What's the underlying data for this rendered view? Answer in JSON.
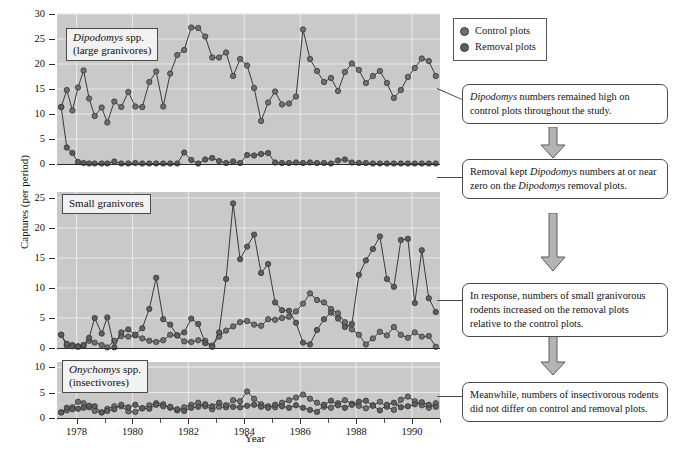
{
  "figure": {
    "x_axis_title": "Year",
    "y_axis_title": "Captures (per period)"
  },
  "legend": {
    "position": "top-right",
    "items": [
      {
        "label": "Control plots",
        "color": "#6f6f6f"
      },
      {
        "label": "Removal plots",
        "color": "#5e5e5e"
      }
    ]
  },
  "panels": [
    {
      "id": "dipodomys",
      "label_line1": "Dipodomys spp.",
      "label_line2": "(large granivores)",
      "label_italic_part": "Dipodomys",
      "yticks": [
        0,
        5,
        10,
        15,
        20,
        25,
        30
      ]
    },
    {
      "id": "small-granivores",
      "label_line1": "Small granivores",
      "label_line2": "",
      "label_italic_part": "",
      "yticks": [
        0,
        5,
        10,
        15,
        20,
        25
      ]
    },
    {
      "id": "onychomys",
      "label_line1": "Onychomys spp.",
      "label_line2": "(insectivores)",
      "label_italic_part": "Onychomys",
      "yticks": [
        0,
        5,
        10
      ]
    }
  ],
  "xticks": [
    {
      "value": 1978,
      "label": "1978"
    },
    {
      "value": 1980,
      "label": "1980"
    },
    {
      "value": 1982,
      "label": "1982"
    },
    {
      "value": 1984,
      "label": "1984"
    },
    {
      "value": 1986,
      "label": "1986"
    },
    {
      "value": 1988,
      "label": "1988"
    },
    {
      "value": 1990,
      "label": "1990"
    }
  ],
  "callouts": [
    {
      "id": "callout-1",
      "text_parts": [
        "",
        "Dipodomys",
        " numbers remained high on control plots throughout the study."
      ],
      "plain_text": "Dipodomys numbers remained high on control plots throughout the study."
    },
    {
      "id": "callout-2",
      "text_parts": [
        "Removal kept ",
        "Dipodomys",
        " numbers at or near zero on the ",
        "Dipodomys",
        " removal plots."
      ],
      "plain_text": "Removal kept Dipodomys numbers at or near zero on the Dipodomys removal plots."
    },
    {
      "id": "callout-3",
      "text_parts": [
        "In response, numbers of small granivorous rodents increased on the removal plots relative to the control plots."
      ],
      "plain_text": "In response, numbers of small granivorous rodents increased on the removal plots relative to the control plots."
    },
    {
      "id": "callout-4",
      "text_parts": [
        "Meanwhile, numbers of insectivorous rodents did not differ on control and removal plots."
      ],
      "plain_text": "Meanwhile, numbers of insectivorous rodents did not differ on control and removal plots."
    }
  ],
  "chart_data": {
    "type": "line",
    "title": "",
    "xlabel": "Year",
    "ylabel": "Captures (per period)",
    "xlim": [
      1977.3,
      1991.0
    ],
    "grid": true,
    "panels": [
      {
        "name": "Dipodomys spp. (large granivores)",
        "ylim": [
          0,
          30
        ],
        "yticks": [
          0,
          5,
          10,
          15,
          20,
          25,
          30
        ],
        "series": [
          {
            "name": "Control plots",
            "x": [
              1977.45,
              1977.65,
              1977.85,
              1978.05,
              1978.25,
              1978.45,
              1978.65,
              1978.9,
              1979.1,
              1979.35,
              1979.6,
              1979.85,
              1980.1,
              1980.35,
              1980.6,
              1980.85,
              1981.1,
              1981.35,
              1981.6,
              1981.85,
              1982.1,
              1982.35,
              1982.6,
              1982.85,
              1983.1,
              1983.35,
              1983.6,
              1983.85,
              1984.1,
              1984.35,
              1984.6,
              1984.85,
              1985.1,
              1985.35,
              1985.6,
              1985.85,
              1986.1,
              1986.35,
              1986.6,
              1986.85,
              1987.1,
              1987.35,
              1987.6,
              1987.85,
              1988.1,
              1988.35,
              1988.6,
              1988.85,
              1989.1,
              1989.35,
              1989.6,
              1989.85,
              1990.1,
              1990.35,
              1990.6,
              1990.85
            ],
            "values": [
              11.4,
              14.8,
              10.7,
              15.3,
              18.7,
              13.1,
              9.6,
              11.3,
              8.3,
              12.5,
              11.4,
              14.4,
              11.5,
              11.4,
              16.4,
              18.5,
              11.5,
              18.1,
              21.8,
              22.8,
              27.3,
              27.2,
              25.5,
              21.3,
              21.3,
              22.3,
              17.6,
              21.0,
              19.7,
              15.2,
              8.6,
              12.3,
              14.5,
              11.9,
              12.1,
              13.5,
              26.9,
              21.0,
              18.6,
              16.4,
              17.2,
              14.6,
              18.4,
              20.1,
              18.8,
              16.2,
              17.6,
              18.6,
              16.2,
              13.2,
              14.8,
              17.4,
              19.2,
              21.1,
              20.6,
              17.6
            ]
          },
          {
            "name": "Removal plots",
            "x": [
              1977.45,
              1977.65,
              1977.85,
              1978.05,
              1978.25,
              1978.45,
              1978.65,
              1978.9,
              1979.1,
              1979.35,
              1979.6,
              1979.85,
              1980.1,
              1980.35,
              1980.6,
              1980.85,
              1981.1,
              1981.35,
              1981.6,
              1981.85,
              1982.1,
              1982.35,
              1982.6,
              1982.85,
              1983.1,
              1983.35,
              1983.6,
              1983.85,
              1984.1,
              1984.35,
              1984.6,
              1984.85,
              1985.1,
              1985.35,
              1985.6,
              1985.85,
              1986.1,
              1986.35,
              1986.6,
              1986.85,
              1987.1,
              1987.35,
              1987.6,
              1987.85,
              1988.1,
              1988.35,
              1988.6,
              1988.85,
              1989.1,
              1989.35,
              1989.6,
              1989.85,
              1990.1,
              1990.35,
              1990.6,
              1990.85
            ],
            "values": [
              11.4,
              3.3,
              2.2,
              0.4,
              0.2,
              0.1,
              0.1,
              0.1,
              0.1,
              0.5,
              0.1,
              0.1,
              0.2,
              0.1,
              0.1,
              0.1,
              0.1,
              0.1,
              0.1,
              2.3,
              0.8,
              0.1,
              0.9,
              1.2,
              0.6,
              0.2,
              0.5,
              0.2,
              1.8,
              1.7,
              2.0,
              2.2,
              0.3,
              0.2,
              0.2,
              0.3,
              0.2,
              0.3,
              0.2,
              0.2,
              0.1,
              0.7,
              0.9,
              0.3,
              0.2,
              0.2,
              0.1,
              0.1,
              0.1,
              0.1,
              0.1,
              0.1,
              0.1,
              0.1,
              0.1,
              0.1
            ]
          }
        ]
      },
      {
        "name": "Small granivores",
        "ylim": [
          0,
          26
        ],
        "yticks": [
          0,
          5,
          10,
          15,
          20,
          25
        ],
        "series": [
          {
            "name": "Control plots",
            "x": [
              1977.45,
              1977.65,
              1977.85,
              1978.05,
              1978.25,
              1978.45,
              1978.65,
              1978.9,
              1979.1,
              1979.35,
              1979.6,
              1979.85,
              1980.1,
              1980.35,
              1980.6,
              1980.85,
              1981.1,
              1981.35,
              1981.6,
              1981.85,
              1982.1,
              1982.35,
              1982.6,
              1982.85,
              1983.1,
              1983.35,
              1983.6,
              1983.85,
              1984.1,
              1984.35,
              1984.6,
              1984.85,
              1985.1,
              1985.35,
              1985.6,
              1985.85,
              1986.1,
              1986.35,
              1986.6,
              1986.85,
              1987.1,
              1987.35,
              1987.6,
              1987.85,
              1988.1,
              1988.35,
              1988.6,
              1988.85,
              1989.1,
              1989.35,
              1989.6,
              1989.85,
              1990.1,
              1990.35,
              1990.6,
              1990.85
            ],
            "values": [
              2.2,
              0.4,
              0.5,
              0.3,
              0.4,
              1.2,
              0.9,
              0.5,
              0.1,
              1.2,
              2.0,
              1.9,
              2.1,
              1.6,
              1.2,
              1.0,
              1.3,
              2.2,
              2.1,
              1.1,
              1.0,
              1.3,
              1.2,
              0.4,
              1.9,
              2.9,
              3.6,
              4.3,
              4.5,
              3.9,
              3.7,
              4.8,
              4.7,
              5.0,
              5.2,
              6.1,
              7.4,
              9.1,
              8.0,
              7.6,
              6.5,
              5.8,
              4.3,
              3.1,
              2.2,
              0.6,
              1.6,
              2.7,
              2.1,
              3.5,
              2.2,
              1.7,
              2.6,
              1.9,
              2.0,
              0.2
            ]
          },
          {
            "name": "Removal plots",
            "x": [
              1977.45,
              1977.65,
              1977.85,
              1978.05,
              1978.25,
              1978.45,
              1978.65,
              1978.9,
              1979.1,
              1979.35,
              1979.6,
              1979.85,
              1980.1,
              1980.35,
              1980.6,
              1980.85,
              1981.1,
              1981.35,
              1981.6,
              1981.85,
              1982.1,
              1982.35,
              1982.6,
              1982.85,
              1983.1,
              1983.35,
              1983.6,
              1983.85,
              1984.1,
              1984.35,
              1984.6,
              1984.85,
              1985.1,
              1985.35,
              1985.6,
              1985.85,
              1986.1,
              1986.35,
              1986.6,
              1986.85,
              1987.1,
              1987.35,
              1987.6,
              1987.85,
              1988.1,
              1988.35,
              1988.6,
              1988.85,
              1989.1,
              1989.35,
              1989.6,
              1989.85,
              1990.1,
              1990.35,
              1990.6,
              1990.85
            ],
            "values": [
              2.2,
              0.7,
              0.3,
              0.2,
              0.5,
              1.7,
              5.0,
              2.4,
              5.1,
              0.1,
              2.6,
              3.1,
              2.2,
              3.3,
              6.5,
              11.7,
              4.8,
              3.9,
              2.1,
              2.6,
              4.9,
              4.0,
              0.8,
              0.2,
              2.6,
              11.5,
              24.1,
              14.8,
              16.9,
              18.9,
              12.5,
              14.0,
              7.6,
              6.3,
              6.2,
              4.2,
              0.9,
              0.6,
              3.0,
              4.8,
              5.9,
              4.9,
              3.5,
              4.0,
              12.2,
              14.6,
              16.5,
              18.6,
              11.5,
              10.2,
              18.0,
              18.2,
              7.5,
              16.3,
              8.3,
              6.0
            ]
          }
        ]
      },
      {
        "name": "Onychomys spp. (insectivores)",
        "ylim": [
          0,
          11
        ],
        "yticks": [
          0,
          5,
          10
        ],
        "series": [
          {
            "name": "Control plots",
            "x": [
              1977.45,
              1977.65,
              1977.85,
              1978.05,
              1978.25,
              1978.45,
              1978.65,
              1978.9,
              1979.1,
              1979.35,
              1979.6,
              1979.85,
              1980.1,
              1980.35,
              1980.6,
              1980.85,
              1981.1,
              1981.35,
              1981.6,
              1981.85,
              1982.1,
              1982.35,
              1982.6,
              1982.85,
              1983.1,
              1983.35,
              1983.6,
              1983.85,
              1984.1,
              1984.35,
              1984.6,
              1984.85,
              1985.1,
              1985.35,
              1985.6,
              1985.85,
              1986.1,
              1986.35,
              1986.6,
              1986.85,
              1987.1,
              1987.35,
              1987.6,
              1987.85,
              1988.1,
              1988.35,
              1988.6,
              1988.85,
              1989.1,
              1989.35,
              1989.6,
              1989.85,
              1990.1,
              1990.35,
              1990.6,
              1990.85
            ],
            "values": [
              1.1,
              1.5,
              2.1,
              3.2,
              2.9,
              2.1,
              1.4,
              1.1,
              1.8,
              2.3,
              2.3,
              1.3,
              1.2,
              1.9,
              2.5,
              2.9,
              2.7,
              2.0,
              1.5,
              2.1,
              2.6,
              3.0,
              2.3,
              1.7,
              2.2,
              2.1,
              3.5,
              3.3,
              5.2,
              3.8,
              2.7,
              2.3,
              2.1,
              3.0,
              3.5,
              4.0,
              4.6,
              3.8,
              3.0,
              2.2,
              2.0,
              2.9,
              3.5,
              2.8,
              2.4,
              1.9,
              2.5,
              3.2,
              2.2,
              1.6,
              3.6,
              4.2,
              3.3,
              2.5,
              2.0,
              2.9
            ]
          },
          {
            "name": "Removal plots",
            "x": [
              1977.45,
              1977.65,
              1977.85,
              1978.05,
              1978.25,
              1978.45,
              1978.65,
              1978.9,
              1979.1,
              1979.35,
              1979.6,
              1979.85,
              1980.1,
              1980.35,
              1980.6,
              1980.85,
              1981.1,
              1981.35,
              1981.6,
              1981.85,
              1982.1,
              1982.35,
              1982.6,
              1982.85,
              1983.1,
              1983.35,
              1983.6,
              1983.85,
              1984.1,
              1984.35,
              1984.6,
              1984.85,
              1985.1,
              1985.35,
              1985.6,
              1985.85,
              1986.1,
              1986.35,
              1986.6,
              1986.85,
              1987.1,
              1987.35,
              1987.6,
              1987.85,
              1988.1,
              1988.35,
              1988.6,
              1988.85,
              1989.1,
              1989.35,
              1989.6,
              1989.85,
              1990.1,
              1990.35,
              1990.6,
              1990.85
            ],
            "values": [
              1.1,
              2.0,
              1.7,
              1.8,
              2.0,
              2.4,
              2.3,
              1.1,
              1.4,
              1.7,
              2.6,
              2.1,
              2.6,
              1.9,
              1.8,
              2.6,
              2.3,
              2.2,
              1.7,
              1.4,
              2.0,
              2.2,
              2.7,
              2.3,
              3.0,
              2.5,
              2.2,
              2.1,
              2.4,
              2.6,
              2.2,
              2.0,
              2.6,
              2.3,
              2.0,
              2.5,
              2.0,
              1.6,
              1.2,
              2.6,
              3.4,
              2.5,
              2.0,
              2.6,
              3.2,
              3.4,
              2.4,
              1.5,
              2.6,
              3.0,
              2.1,
              2.3,
              2.7,
              3.1,
              2.6,
              2.2
            ]
          }
        ]
      }
    ]
  }
}
